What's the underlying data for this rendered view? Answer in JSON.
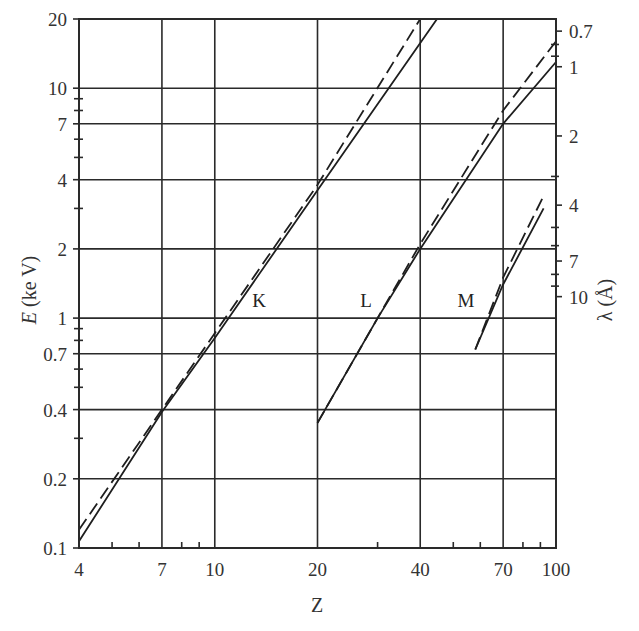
{
  "chart_data": {
    "type": "line",
    "title": "",
    "xlabel": "Z",
    "ylabel": "E (ke V)",
    "ylabel_right": "λ (Å)",
    "xscale": "log",
    "yscale": "log",
    "xlim": [
      4,
      100
    ],
    "ylim": [
      0.1,
      20
    ],
    "grid": true,
    "x_ticks": [
      4,
      7,
      10,
      20,
      40,
      70,
      100
    ],
    "x_tick_labels": [
      "4",
      "7",
      "10",
      "20",
      "40",
      "70",
      "100"
    ],
    "y_ticks": [
      0.1,
      0.2,
      0.4,
      0.7,
      1,
      2,
      4,
      7,
      10,
      20
    ],
    "y_tick_labels": [
      "0.1",
      "0.2",
      "0.4",
      "0.7",
      "1",
      "2",
      "4",
      "7",
      "10",
      "20"
    ],
    "y_right_ticks": [
      0.1,
      0.2,
      0.4,
      0.7,
      1,
      2,
      4,
      7,
      10
    ],
    "y_right_tick_labels": [
      "0.1",
      "0.2",
      "0.4",
      "0.7",
      "1",
      "2",
      "4",
      "7",
      "10"
    ],
    "series": [
      {
        "name": "K",
        "style": "solid",
        "x": [
          4,
          7,
          10,
          20,
          44.8
        ],
        "y": [
          0.107,
          0.39,
          0.82,
          3.6,
          20
        ]
      },
      {
        "name": "K",
        "style": "dashed",
        "x": [
          4,
          7,
          10,
          20,
          40
        ],
        "y": [
          0.12,
          0.4,
          0.86,
          3.8,
          20
        ]
      },
      {
        "name": "L",
        "style": "solid",
        "x": [
          20,
          30,
          40,
          70,
          100
        ],
        "y": [
          0.35,
          1.0,
          2.0,
          7.0,
          13
        ]
      },
      {
        "name": "L",
        "style": "dashed",
        "x": [
          20,
          30,
          40,
          70,
          100
        ],
        "y": [
          0.35,
          1.0,
          2.1,
          8.0,
          16
        ]
      },
      {
        "name": "M",
        "style": "solid",
        "x": [
          58,
          70,
          92
        ],
        "y": [
          0.73,
          1.4,
          3.0
        ]
      },
      {
        "name": "M",
        "style": "dashed",
        "x": [
          58,
          70,
          92
        ],
        "y": [
          0.73,
          1.5,
          3.4
        ]
      }
    ],
    "annotations": [
      {
        "text": "K",
        "x": 13.5,
        "y": 1.15
      },
      {
        "text": "L",
        "x": 28,
        "y": 1.15
      },
      {
        "text": "M",
        "x": 58,
        "y": 1.15
      }
    ]
  },
  "labels": {
    "xlabel": "Z",
    "ylabel_italic": "E",
    "ylabel_rest": " (ke V)",
    "ylabel_right": "λ (Å)",
    "K": "K",
    "L": "L",
    "M": "M"
  }
}
